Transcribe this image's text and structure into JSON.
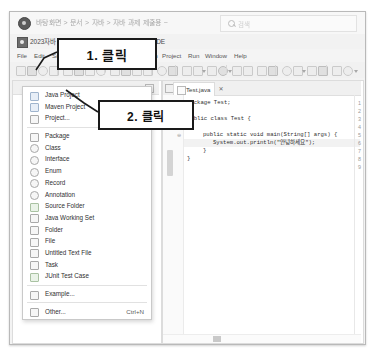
{
  "explorer": {
    "path_text": "바탕화면 > 문서 > 자바 > 자바 과제 제출용 ~",
    "search_placeholder": "검색",
    "search_icon": "search-icon",
    "app_icon": "explorer-icon"
  },
  "eclipse": {
    "icon": "eclipse-icon",
    "title": "2023자바 - Test/src/Test/Test.java - Eclipse IDE",
    "menus": [
      {
        "label": "File",
        "x": 7
      },
      {
        "label": "Edit",
        "x": 24
      },
      {
        "label": "Source",
        "x": 42
      },
      {
        "label": "Refactor",
        "x": 66
      },
      {
        "label": "Navigate",
        "x": 96
      },
      {
        "label": "Search",
        "x": 128
      },
      {
        "label": "Project",
        "x": 152
      },
      {
        "label": "Run",
        "x": 178
      },
      {
        "label": "Window",
        "x": 195
      },
      {
        "label": "Help",
        "x": 224
      }
    ]
  },
  "new_menu": {
    "items": [
      {
        "label": "Java Project",
        "icon": "java-project-icon",
        "shortcut": "",
        "style": "blue"
      },
      {
        "label": "Maven Project",
        "icon": "maven-project-icon",
        "shortcut": "",
        "style": "blue"
      },
      {
        "label": "Project...",
        "icon": "project-icon",
        "shortcut": "",
        "style": ""
      },
      {
        "sep": true
      },
      {
        "label": "Package",
        "icon": "package-icon",
        "shortcut": "",
        "style": ""
      },
      {
        "label": "Class",
        "icon": "class-icon",
        "shortcut": "",
        "style": "circ"
      },
      {
        "label": "Interface",
        "icon": "interface-icon",
        "shortcut": "",
        "style": "circ"
      },
      {
        "label": "Enum",
        "icon": "enum-icon",
        "shortcut": "",
        "style": "circ"
      },
      {
        "label": "Record",
        "icon": "record-icon",
        "shortcut": "",
        "style": "circ"
      },
      {
        "label": "Annotation",
        "icon": "annotation-icon",
        "shortcut": "",
        "style": "circ"
      },
      {
        "label": "Source Folder",
        "icon": "source-folder-icon",
        "shortcut": "",
        "style": "grn"
      },
      {
        "label": "Java Working Set",
        "icon": "working-set-icon",
        "shortcut": "",
        "style": ""
      },
      {
        "label": "Folder",
        "icon": "folder-icon",
        "shortcut": "",
        "style": ""
      },
      {
        "label": "File",
        "icon": "file-icon",
        "shortcut": "",
        "style": ""
      },
      {
        "label": "Untitled Text File",
        "icon": "text-file-icon",
        "shortcut": "",
        "style": ""
      },
      {
        "label": "Task",
        "icon": "task-icon",
        "shortcut": "",
        "style": ""
      },
      {
        "label": "JUnit Test Case",
        "icon": "junit-icon",
        "shortcut": "",
        "style": "grn"
      },
      {
        "sep": true
      },
      {
        "label": "Example...",
        "icon": "example-icon",
        "shortcut": "",
        "style": ""
      },
      {
        "sep": true
      },
      {
        "label": "Other...",
        "icon": "other-icon",
        "shortcut": "Ctrl+N",
        "style": ""
      }
    ]
  },
  "editor": {
    "tab_label": "Test.java",
    "tab_icon": "java-file-icon",
    "close_icon": "close-icon",
    "lines": [
      {
        "no": "1",
        "text": "package Test;",
        "top": 18,
        "indent": 0,
        "fold": ""
      },
      {
        "no": "2",
        "text": "",
        "top": 26,
        "indent": 0,
        "fold": ""
      },
      {
        "no": "3",
        "text": "public class Test {",
        "top": 34,
        "indent": 0,
        "fold": ""
      },
      {
        "no": "4",
        "text": "",
        "top": 42,
        "indent": 0,
        "fold": ""
      },
      {
        "no": "5",
        "text": "public static void main(String[] args) {",
        "top": 50,
        "indent": 16,
        "fold": "⊖"
      },
      {
        "no": "6",
        "text": "System.out.println(\"안녕하세요\");",
        "top": 58,
        "indent": 26,
        "fold": ""
      },
      {
        "no": "7",
        "text": "}",
        "top": 66,
        "indent": 16,
        "fold": ""
      },
      {
        "no": "8",
        "text": "}",
        "top": 74,
        "indent": 0,
        "fold": ""
      },
      {
        "no": "9",
        "text": "",
        "top": 82,
        "indent": 0,
        "fold": ""
      }
    ],
    "highlight_line_index": 5
  },
  "annotations": [
    {
      "label": "1. 클릭",
      "name": "callout-step-1"
    },
    {
      "label": "2. 클릭",
      "name": "callout-step-2"
    }
  ]
}
